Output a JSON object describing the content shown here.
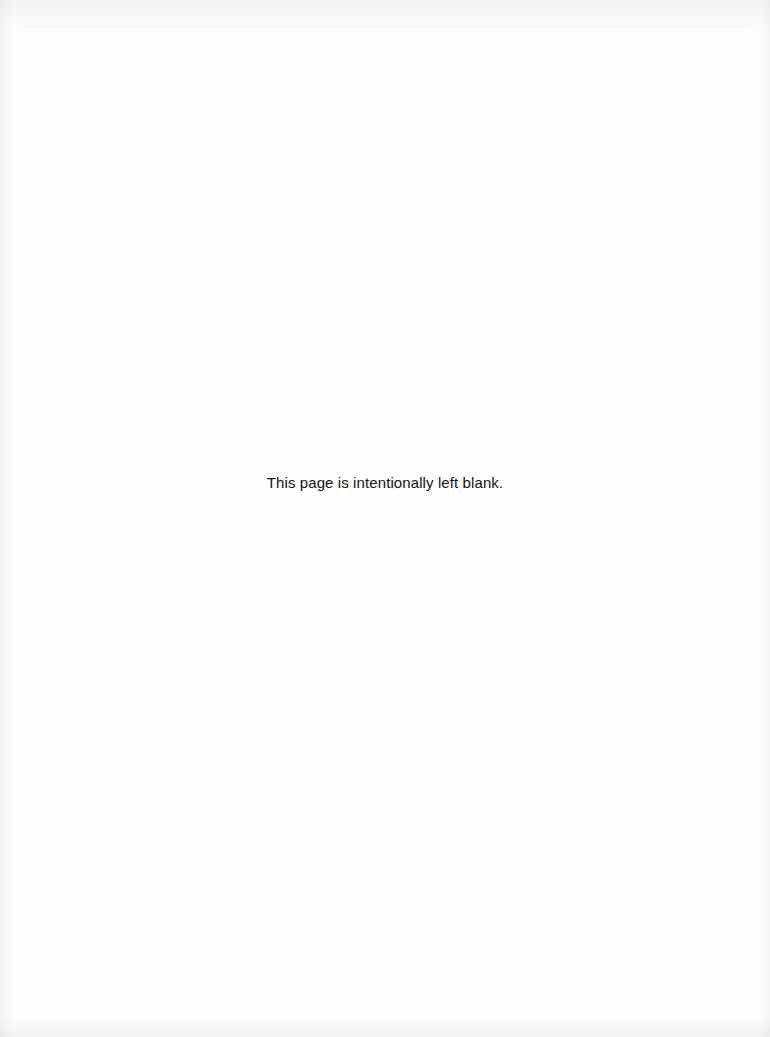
{
  "page": {
    "notice": "This page is intentionally left blank."
  }
}
